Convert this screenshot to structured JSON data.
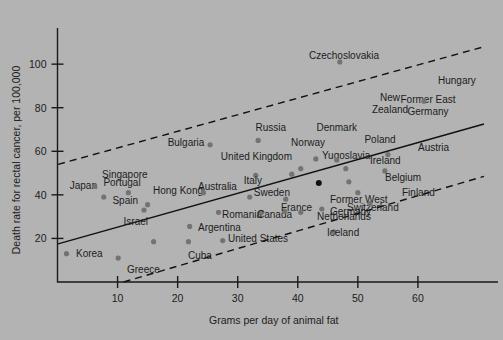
{
  "chart_data": {
    "type": "scatter",
    "title": "",
    "xlabel": "Grams per day of animal fat",
    "ylabel": "Death rate for rectal cancer, per 100,000",
    "xlim": [
      0,
      72
    ],
    "ylim": [
      0,
      112
    ],
    "xticks": [
      10,
      20,
      30,
      40,
      50,
      60
    ],
    "yticks": [
      20,
      40,
      60,
      80,
      100
    ],
    "grid": false,
    "legend": false,
    "regression_line": {
      "x": [
        0.1,
        71
      ],
      "y": [
        17.5,
        72.5
      ],
      "style": "solid"
    },
    "upper_band": {
      "x": [
        0.1,
        71
      ],
      "y": [
        54,
        108
      ],
      "style": "dashed"
    },
    "lower_band": {
      "x": [
        11,
        71
      ],
      "y": [
        0,
        48.5
      ],
      "style": "dashed"
    },
    "points": [
      {
        "label": "Korea",
        "x": 1.5,
        "y": 13.0,
        "lx": 76,
        "ly": 257,
        "anchor": "start"
      },
      {
        "label": "Japan",
        "x": 7.7,
        "y": 39.0,
        "lx": 97,
        "ly": 189,
        "anchor": "end"
      },
      {
        "label": "Singapore",
        "x": 6.2,
        "y": 44.0,
        "lx": 102,
        "ly": 178,
        "anchor": "start"
      },
      {
        "label": "Portugal",
        "x": 11.8,
        "y": 41.0,
        "lx": 122,
        "ly": 186,
        "anchor": "middle"
      },
      {
        "label": "Spain",
        "x": 14.4,
        "y": 33.0,
        "lx": 138,
        "ly": 204,
        "anchor": "end"
      },
      {
        "label": "Hong Kong",
        "x": 15.0,
        "y": 35.5,
        "lx": 153,
        "ly": 194,
        "anchor": "start"
      },
      {
        "label": "Israel",
        "x": 16.0,
        "y": 18.5,
        "lx": 148,
        "ly": 225,
        "anchor": "end"
      },
      {
        "label": "Greece",
        "x": 10.1,
        "y": 11.0,
        "lx": 127,
        "ly": 273,
        "anchor": "start"
      },
      {
        "label": "Cuba",
        "x": 21.8,
        "y": 18.5,
        "lx": 188,
        "ly": 259,
        "anchor": "start"
      },
      {
        "label": "Argentina",
        "x": 22.0,
        "y": 25.5,
        "lx": 198,
        "ly": 231,
        "anchor": "start"
      },
      {
        "label": "Australia",
        "x": 24.3,
        "y": 41.0,
        "lx": 198,
        "ly": 190,
        "anchor": "start"
      },
      {
        "label": "Bulgaria",
        "x": 25.4,
        "y": 63.0,
        "lx": 186,
        "ly": 146,
        "anchor": "middle"
      },
      {
        "label": "Romania",
        "x": 26.8,
        "y": 32.0,
        "lx": 222,
        "ly": 218,
        "anchor": "start"
      },
      {
        "label": "United States",
        "x": 27.5,
        "y": 19.0,
        "lx": 228,
        "ly": 242,
        "anchor": "start"
      },
      {
        "label": "United Kingdom",
        "x": 33.0,
        "y": 49.0,
        "lx": 292,
        "ly": 160,
        "anchor": "end"
      },
      {
        "label": "Italy",
        "x": 32.0,
        "y": 39.0,
        "lx": 262,
        "ly": 184,
        "anchor": "end"
      },
      {
        "label": "Canada",
        "x": 34.0,
        "y": 32.0,
        "lx": 292,
        "ly": 218,
        "anchor": "end"
      },
      {
        "label": "Russia",
        "x": 33.4,
        "y": 65.0,
        "lx": 286,
        "ly": 131,
        "anchor": "end"
      },
      {
        "label": "Sweden",
        "x": 38.0,
        "y": 38.0,
        "lx": 290,
        "ly": 196,
        "anchor": "end"
      },
      {
        "label": "France",
        "x": 37.8,
        "y": 32.5,
        "lx": 312,
        "ly": 211,
        "anchor": "end"
      },
      {
        "label": "Netherlands",
        "x": 40.5,
        "y": 32.0,
        "lx": 317,
        "ly": 220,
        "anchor": "start"
      },
      {
        "label": "Norway",
        "x": 40.5,
        "y": 52.0,
        "lx": 325,
        "ly": 146,
        "anchor": "end"
      },
      {
        "label": "Yugoslavia",
        "x": 39.0,
        "y": 49.5,
        "lx": 322,
        "ly": 159,
        "anchor": "start"
      },
      {
        "label": "Denmark",
        "x": 43.0,
        "y": 56.5,
        "lx": 357,
        "ly": 131,
        "anchor": "end"
      },
      {
        "label": "Former West Germany",
        "x": 43.5,
        "y": 45.5,
        "lx": 330,
        "ly": 203,
        "anchor": "start"
      },
      {
        "label": "Switzerland",
        "x": 44.0,
        "y": 33.5,
        "lx": 347,
        "ly": 211,
        "anchor": "start"
      },
      {
        "label": "Iceland",
        "x": 46.0,
        "y": 23.0,
        "lx": 327,
        "ly": 236,
        "anchor": "start"
      },
      {
        "label": "Czechoslovakia",
        "x": 47.0,
        "y": 101.0,
        "lx": 344,
        "ly": 59,
        "anchor": "middle"
      },
      {
        "label": "New Zealand",
        "x": 46.5,
        "y": 56.0,
        "lx": 390,
        "ly": 101,
        "anchor": "middle"
      },
      {
        "label": "Poland",
        "x": 48.0,
        "y": 52.0,
        "lx": 380,
        "ly": 143,
        "anchor": "middle"
      },
      {
        "label": "Ireland",
        "x": 48.5,
        "y": 46.0,
        "lx": 370,
        "ly": 164,
        "anchor": "start"
      },
      {
        "label": "Belgium",
        "x": 50.0,
        "y": 41.0,
        "lx": 385,
        "ly": 181,
        "anchor": "start"
      },
      {
        "label": "Finland",
        "x": 52.0,
        "y": 36.0,
        "lx": 402,
        "ly": 196,
        "anchor": "start"
      },
      {
        "label": "Austria",
        "x": 54.5,
        "y": 51.0,
        "lx": 418,
        "ly": 151,
        "anchor": "start"
      },
      {
        "label": "Former East Germany",
        "x": 55.0,
        "y": 58.5,
        "lx": 428,
        "ly": 103,
        "anchor": "middle"
      },
      {
        "label": "Hungary",
        "x": 61.0,
        "y": 83.0,
        "lx": 438,
        "ly": 84,
        "anchor": "start"
      }
    ]
  }
}
